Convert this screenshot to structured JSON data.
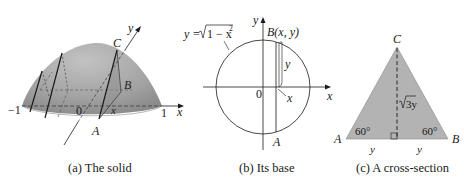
{
  "panels": [
    {
      "id": "a",
      "caption": "(a) The solid",
      "labels": {
        "x_axis": "x",
        "y_axis": "y",
        "neg_one": "−1",
        "zero": "0",
        "one": "1",
        "point_A": "A",
        "point_B": "B",
        "point_C": "C",
        "x_pos": "x"
      }
    },
    {
      "id": "b",
      "caption": "(b) Its base",
      "labels": {
        "equation": "y = √1 − x²",
        "equation_lhs": "y = ",
        "equation_radicand": "1 − x",
        "equation_exp": "2",
        "x_axis": "x",
        "y_axis": "y",
        "zero": "0",
        "point_B": "B(x, y)",
        "point_A": "A",
        "x_dist": "x",
        "y_dist": "y"
      }
    },
    {
      "id": "c",
      "caption": "(c) A cross-section",
      "labels": {
        "point_A": "A",
        "point_B": "B",
        "point_C": "C",
        "angle_left": "60°",
        "angle_right": "60°",
        "height": "3y",
        "base_left": "y",
        "base_right": "y"
      }
    }
  ],
  "colors": {
    "dome_fill": "#a6a6a6",
    "dome_shade": "#8c8c8c",
    "triangle_fill": "#b3b3b3",
    "line": "#1a1a1a"
  }
}
